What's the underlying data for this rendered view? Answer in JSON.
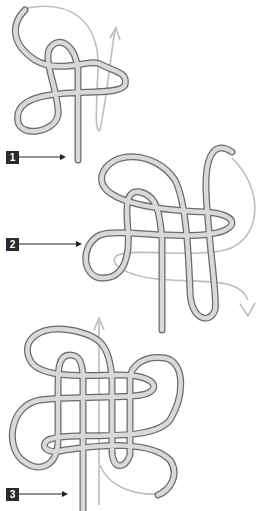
{
  "steps": [
    {
      "number": "1",
      "label": "Step 1"
    },
    {
      "number": "2",
      "label": "Step 2"
    },
    {
      "number": "3",
      "label": "Step 3"
    }
  ],
  "colors": {
    "rope_outline": "#6a6a6a",
    "rope_fill": "#d9d9d9",
    "guide_arrow": "#bdbdbd",
    "badge": "#2a2a2a"
  }
}
